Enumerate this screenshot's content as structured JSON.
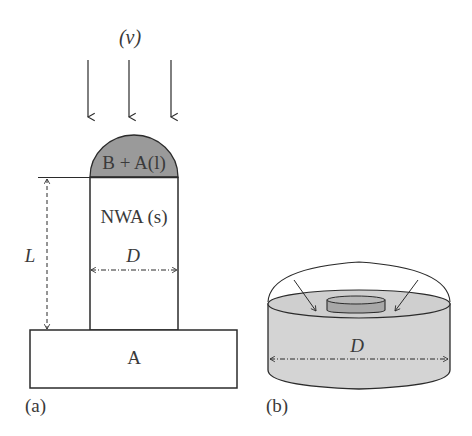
{
  "figure": {
    "panel_a": {
      "caption": "(a)",
      "radiation_label": "(ν)",
      "droplet_label": "B + A(l)",
      "nanowire_label": "NWA (s)",
      "diameter_label": "D",
      "length_label": "L",
      "substrate_label": "A",
      "arrow_count": 3
    },
    "panel_b": {
      "caption": "(b)",
      "diameter_label": "D"
    },
    "colors": {
      "stroke": "#2b2b2b",
      "droplet_fill": "#9a9a9a",
      "cylinder_fill": "#d4d4d4",
      "inner_disc_fill": "#a8a8a8"
    }
  }
}
